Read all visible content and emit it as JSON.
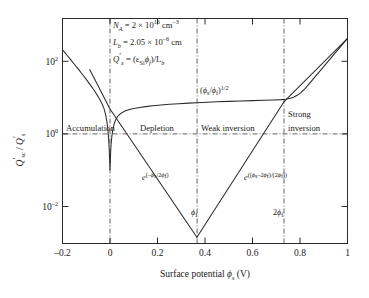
{
  "chart_data": {
    "type": "line",
    "title": "",
    "xlabel": "Surface potential ϕs (V)",
    "ylabel": "Q'sc / Q's",
    "xlim": [
      -0.2,
      1.0
    ],
    "ylim_log10": [
      -3.5,
      2.7
    ],
    "xticks": [
      "–0.2",
      "0",
      "0.2",
      "0.4",
      "0.6",
      "0.8",
      "1"
    ],
    "xtick_values": [
      -0.2,
      0,
      0.2,
      0.4,
      0.6,
      0.8,
      1.0
    ],
    "yticks": [
      "10",
      "10",
      "10"
    ],
    "ytick_exponents": [
      "2",
      "0",
      "–2"
    ],
    "ytick_values": [
      100,
      1,
      0.01
    ],
    "grid": false,
    "legend": "none",
    "markers": {
      "phi_f": 0.366,
      "two_phi_f": 0.732,
      "zero": 0.0,
      "unity_line_y": 1.0
    },
    "series": [
      {
        "name": "total space charge Q'sc/Q's",
        "comment": "V-shaped total charge: high in accumulation, dips near flat band, depletion sqrt rise, strong inversion exponential rise",
        "points_xy_log10": [
          [
            -0.2,
            1.84
          ],
          [
            -0.19,
            1.76
          ],
          [
            -0.18,
            1.68
          ],
          [
            -0.17,
            1.6
          ],
          [
            -0.16,
            1.52
          ],
          [
            -0.15,
            1.44
          ],
          [
            -0.14,
            1.358
          ],
          [
            -0.13,
            1.276
          ],
          [
            -0.12,
            1.192
          ],
          [
            -0.11,
            1.108
          ],
          [
            -0.1,
            1.022
          ],
          [
            -0.09,
            0.934
          ],
          [
            -0.08,
            0.844
          ],
          [
            -0.07,
            0.75
          ],
          [
            -0.06,
            0.652
          ],
          [
            -0.05,
            0.548
          ],
          [
            -0.04,
            0.434
          ],
          [
            -0.032,
            0.33
          ],
          [
            -0.026,
            0.23
          ],
          [
            -0.021,
            0.12
          ],
          [
            -0.017,
            0.0
          ],
          [
            -0.013,
            -0.15
          ],
          [
            -0.01,
            -0.3
          ],
          [
            -0.007,
            -0.5
          ],
          [
            -0.005,
            -0.7
          ],
          [
            -0.003,
            -0.95
          ],
          [
            -0.0018,
            -1.15
          ],
          [
            -0.001,
            -1.3
          ],
          [
            -0.0004,
            -1.42
          ],
          [
            0.0,
            -1.47
          ],
          [
            0.0004,
            -1.42
          ],
          [
            0.001,
            -1.3
          ],
          [
            0.0018,
            -1.15
          ],
          [
            0.003,
            -0.95
          ],
          [
            0.005,
            -0.73
          ],
          [
            0.008,
            -0.53
          ],
          [
            0.012,
            -0.36
          ],
          [
            0.017,
            -0.215
          ],
          [
            0.023,
            -0.105
          ],
          [
            0.03,
            -0.02
          ],
          [
            0.04,
            0.055
          ],
          [
            0.052,
            0.112
          ],
          [
            0.066,
            0.156
          ],
          [
            0.082,
            0.19
          ],
          [
            0.1,
            0.218
          ],
          [
            0.125,
            0.248
          ],
          [
            0.15,
            0.272
          ],
          [
            0.18,
            0.295
          ],
          [
            0.215,
            0.317
          ],
          [
            0.25,
            0.335
          ],
          [
            0.29,
            0.353
          ],
          [
            0.33,
            0.368
          ],
          [
            0.366,
            0.381
          ],
          [
            0.41,
            0.394
          ],
          [
            0.45,
            0.404
          ],
          [
            0.5,
            0.416
          ],
          [
            0.55,
            0.427
          ],
          [
            0.6,
            0.437
          ],
          [
            0.65,
            0.447
          ],
          [
            0.69,
            0.456
          ],
          [
            0.72,
            0.465
          ],
          [
            0.74,
            0.476
          ],
          [
            0.76,
            0.5
          ],
          [
            0.775,
            0.535
          ],
          [
            0.79,
            0.59
          ],
          [
            0.805,
            0.665
          ],
          [
            0.82,
            0.76
          ],
          [
            0.835,
            0.87
          ],
          [
            0.85,
            0.99
          ],
          [
            0.87,
            1.145
          ],
          [
            0.89,
            1.3
          ],
          [
            0.91,
            1.455
          ],
          [
            0.93,
            1.61
          ],
          [
            0.95,
            1.765
          ],
          [
            0.97,
            1.92
          ],
          [
            0.985,
            2.035
          ],
          [
            1.0,
            2.15
          ]
        ]
      },
      {
        "name": "exp(-ϕs/2ϕt) hole component",
        "comment": "descending straight line on semilog from accumulation down to minimum at phi_f",
        "points_xy_log10": [
          [
            -0.085,
            1.29
          ],
          [
            0.0,
            0.205
          ],
          [
            0.366,
            -3.33
          ]
        ]
      },
      {
        "name": "exp((ϕs-2ϕf)/(2ϕt)) electron component",
        "comment": "ascending straight line on semilog from minimum at phi_f up through strong inversion",
        "points_xy_log10": [
          [
            0.366,
            -3.33
          ],
          [
            0.732,
            0.4
          ],
          [
            1.0,
            2.15
          ]
        ]
      }
    ],
    "annotations": [
      {
        "id": "param-1",
        "text": "NA = 2 × 10^16 cm^-3",
        "x": 0.02,
        "y_log10": 2.3
      },
      {
        "id": "param-2",
        "text": "Lb = 2.05 × 10^-6 cm",
        "x": 0.02,
        "y_log10": 1.85
      },
      {
        "id": "param-3",
        "text": "Q'x = (εSi ϕf)/Lb",
        "x": 0.02,
        "y_log10": 1.4
      },
      {
        "id": "sqrt-branch",
        "text": "(ϕs/ϕt)^1/2",
        "x": 0.4,
        "y_log10": 0.72
      },
      {
        "id": "exp-left",
        "text": "e^(–ϕs/2ϕt)",
        "x": 0.215,
        "y_log10": -1.02
      },
      {
        "id": "exp-right",
        "text": "e^((ϕs–2ϕf)/(2ϕt))",
        "x": 0.645,
        "y_log10": -1.02
      }
    ],
    "region_labels": [
      {
        "id": "accumulation",
        "text": "Accumulation",
        "x": -0.155,
        "y_log10": 0.13
      },
      {
        "id": "depletion",
        "text": "Depletion",
        "x": 0.105,
        "y_log10": 0.13
      },
      {
        "id": "weak-inversion",
        "text": "Weak inversion",
        "x": 0.425,
        "y_log10": 0.13
      },
      {
        "id": "strong-inversion-line1",
        "text": "Strong",
        "x": 0.805,
        "y_log10": 0.52
      },
      {
        "id": "strong-inversion-line2",
        "text": "inversion",
        "x": 0.805,
        "y_log10": 0.13
      }
    ],
    "axis_markers": [
      {
        "id": "phi-f-marker",
        "text": "ϕf",
        "x": 0.366
      },
      {
        "id": "two-phi-f-marker",
        "text": "2ϕf",
        "x": 0.732
      }
    ]
  },
  "params": {
    "na_symbol": "N",
    "na_sub": "A",
    "na_value": " = 2 × 10",
    "na_exp": "16",
    "na_unit": " cm",
    "na_unit_exp": "–3",
    "lb_symbol": "L",
    "lb_sub": "b",
    "lb_value": " = 2.05 × 10",
    "lb_exp": "–6",
    "lb_unit": " cm",
    "qx_symbol": "Q",
    "qx_prime": "′",
    "qx_sub": "x",
    "qx_eq": " = (ε",
    "qx_eps_sub": "Si",
    "qx_phi": "ϕ",
    "qx_phi_sub": "f",
    "qx_close": ")/L",
    "qx_lb_sub": "b"
  },
  "axes": {
    "y_title_q1": "Q",
    "y_title_prime1": "′",
    "y_title_sub1": "sc",
    "y_title_slash": " / ",
    "y_title_q2": "Q",
    "y_title_prime2": "′",
    "y_title_sub2": "s",
    "x_title_text": "Surface potential ",
    "x_title_phi": "ϕ",
    "x_title_sub": "s",
    "x_title_unit": " (V)",
    "ytick_base": "10"
  }
}
